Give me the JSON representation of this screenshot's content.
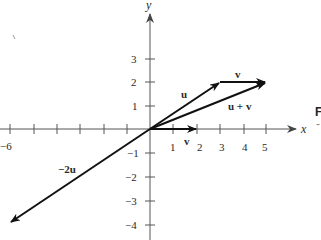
{
  "figure": {
    "type": "vector-diagram",
    "axes": {
      "x_label": "x",
      "y_label": "y",
      "x_ticks": [
        {
          "value": -6,
          "label": "−6"
        },
        {
          "value": 1,
          "label": "1"
        },
        {
          "value": 2,
          "label": "2"
        },
        {
          "value": 3,
          "label": "3"
        },
        {
          "value": 4,
          "label": "4"
        },
        {
          "value": 5,
          "label": "5"
        }
      ],
      "y_ticks": [
        {
          "value": 3,
          "label": "3"
        },
        {
          "value": 2,
          "label": "2"
        },
        {
          "value": 1,
          "label": "1"
        },
        {
          "value": -1,
          "label": "−1"
        },
        {
          "value": -2,
          "label": "−2"
        },
        {
          "value": -3,
          "label": "−3"
        },
        {
          "value": -4,
          "label": "−4"
        }
      ]
    },
    "vectors": [
      {
        "name": "u",
        "label": "u",
        "from": [
          0,
          0
        ],
        "to": [
          3,
          2
        ]
      },
      {
        "name": "v-translated",
        "label": "v",
        "from": [
          3,
          2
        ],
        "to": [
          5,
          2
        ]
      },
      {
        "name": "u-plus-v",
        "label": "u + v",
        "from": [
          0,
          0
        ],
        "to": [
          5,
          2
        ]
      },
      {
        "name": "v",
        "label": "v",
        "from": [
          0,
          0
        ],
        "to": [
          2,
          0
        ]
      },
      {
        "name": "minus-2u",
        "label": "−2u",
        "from": [
          0,
          0
        ],
        "to": [
          -6,
          -4
        ]
      }
    ],
    "side_text": {
      "char": "F",
      "dash": "-"
    },
    "colors": {
      "vector": "#111111",
      "axis": "#555555",
      "text": "#2a2a2a"
    }
  }
}
